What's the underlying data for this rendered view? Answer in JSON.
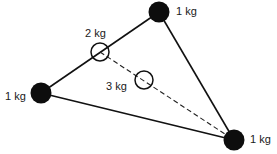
{
  "diagram": {
    "masses": [
      {
        "id": "top",
        "label": "1 kg",
        "x": 159,
        "y": 12,
        "r": 10.5,
        "type": "solid"
      },
      {
        "id": "left",
        "label": "1 kg",
        "x": 41,
        "y": 93,
        "r": 10.5,
        "type": "solid"
      },
      {
        "id": "bottom-right",
        "label": "1 kg",
        "x": 234,
        "y": 140,
        "r": 10.5,
        "type": "solid"
      }
    ],
    "centres": [
      {
        "id": "pair-centre",
        "label": "2 kg",
        "x": 100,
        "y": 52,
        "r": 9,
        "type": "hollow"
      },
      {
        "id": "triangle-centre",
        "label": "3 kg",
        "x": 144,
        "y": 80,
        "r": 9,
        "type": "hollow"
      }
    ],
    "edges": [
      {
        "from": "left",
        "to": "top",
        "style": "solid"
      },
      {
        "from": "top",
        "to": "bottom-right",
        "style": "solid"
      },
      {
        "from": "left",
        "to": "bottom-right",
        "style": "solid"
      },
      {
        "from": "pair-centre",
        "to": "bottom-right",
        "style": "dashed"
      }
    ],
    "colors": {
      "ink": "#111111",
      "background": "#ffffff"
    }
  }
}
